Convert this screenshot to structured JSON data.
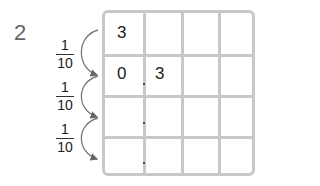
{
  "problem_number": "2",
  "fractions": [
    {
      "numerator": "1",
      "denominator": "10"
    },
    {
      "numerator": "1",
      "denominator": "10"
    },
    {
      "numerator": "1",
      "denominator": "10"
    }
  ],
  "grid": {
    "rows": 4,
    "cols": 4,
    "cells": [
      [
        "3",
        "",
        "",
        ""
      ],
      [
        "0",
        "3",
        "",
        ""
      ],
      [
        "",
        "",
        "",
        ""
      ],
      [
        "",
        "",
        "",
        ""
      ]
    ],
    "decimal_points_after_col": 0
  },
  "colors": {
    "grid_line": "#c8c8c8",
    "arrow": "#666666",
    "number": "#666666"
  }
}
